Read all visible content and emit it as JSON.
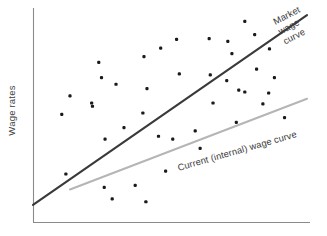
{
  "chart_data": {
    "type": "scatter",
    "title": "",
    "xlabel": "",
    "ylabel": "Wage rates",
    "xlim": [
      0,
      100
    ],
    "ylim": [
      0,
      100
    ],
    "grid": false,
    "legend_position": "inline-annotations",
    "axes": {
      "y_axis_label": "Wage rates",
      "x_axis_label": "",
      "x_tick_labels": [],
      "y_tick_labels": []
    },
    "annotations": [
      {
        "name": "market-wage-curve-label",
        "text": "Market wage curve",
        "lines": [
          "Market",
          "wage",
          "curve"
        ],
        "color": "#3a3a3a",
        "rotation_deg": -27
      },
      {
        "name": "current-wage-curve-label",
        "text": "Current (internal) wage curve",
        "lines": [
          "Current (internal) wage curve"
        ],
        "color": "#3a3a3a",
        "rotation_deg": -16
      }
    ],
    "series": [
      {
        "name": "Market wage curve",
        "type": "line",
        "color": "#3a3a3a",
        "points": [
          [
            0.0,
            5.0
          ],
          [
            100.0,
            98.0
          ]
        ]
      },
      {
        "name": "Current (internal) wage curve",
        "type": "line",
        "color": "#b5b5b5",
        "points": [
          [
            13.5,
            12.5
          ],
          [
            100.0,
            57.0
          ]
        ]
      },
      {
        "name": "Observed wage data",
        "type": "scatter",
        "color": "#1a1a1a",
        "points": [
          [
            24.0,
            74.8
          ],
          [
            25.0,
            67.3
          ],
          [
            13.5,
            58.4
          ],
          [
            21.7,
            53.3
          ],
          [
            52.4,
            86.1
          ],
          [
            64.3,
            86.5
          ],
          [
            46.6,
            81.8
          ],
          [
            40.5,
            77.6
          ],
          [
            53.4,
            69.2
          ],
          [
            64.7,
            68.7
          ],
          [
            30.3,
            64.1
          ],
          [
            41.6,
            61.9
          ],
          [
            77.3,
            94.9
          ],
          [
            80.9,
            88.4
          ],
          [
            71.1,
            85.1
          ],
          [
            72.6,
            79.1
          ],
          [
            86.3,
            81.4
          ],
          [
            81.6,
            71.5
          ],
          [
            88.1,
            67.3
          ],
          [
            70.7,
            65.9
          ],
          [
            75.1,
            61.2
          ],
          [
            77.3,
            60.3
          ],
          [
            86.0,
            59.8
          ],
          [
            21.4,
            54.9
          ],
          [
            10.5,
            49.3
          ],
          [
            33.2,
            42.8
          ],
          [
            26.3,
            37.2
          ],
          [
            51.0,
            37.2
          ],
          [
            40.1,
            50.0
          ],
          [
            12.0,
            20.1
          ],
          [
            37.3,
            14.5
          ],
          [
            28.9,
            7.9
          ],
          [
            41.2,
            6.5
          ],
          [
            26.0,
            13.5
          ],
          [
            65.7,
            54.9
          ],
          [
            83.9,
            54.5
          ],
          [
            45.8,
            38.6
          ],
          [
            59.2,
            41.2
          ],
          [
            74.2,
            45.4
          ],
          [
            91.8,
            47.7
          ],
          [
            61.0,
            32.7
          ],
          [
            48.4,
            21.5
          ]
        ]
      }
    ]
  },
  "labels": {
    "y_axis": "Wage rates",
    "market_line_1": "Market",
    "market_line_2": "wage",
    "market_line_3": "curve",
    "current_curve": "Current (internal) wage curve"
  }
}
